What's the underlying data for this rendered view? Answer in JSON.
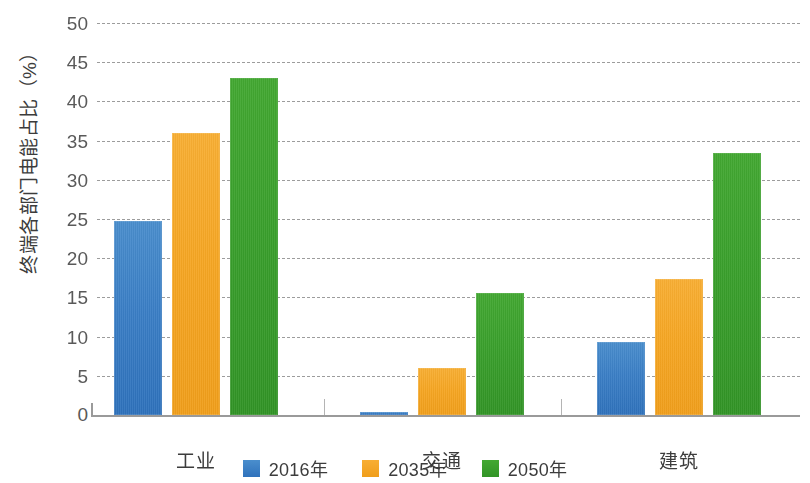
{
  "chart_data": {
    "type": "bar",
    "title": "",
    "subtitle": "",
    "xlabel": "",
    "ylabel": "终端各部门电能占比（%）",
    "ylim": [
      0,
      50
    ],
    "ytick_step": 5,
    "yticks": [
      "50",
      "45",
      "40",
      "35",
      "30",
      "25",
      "20",
      "15",
      "10",
      "5",
      "0"
    ],
    "ytick_values": [
      50,
      45,
      40,
      35,
      30,
      25,
      20,
      15,
      10,
      5,
      0
    ],
    "grid": true,
    "grid_style": "dashed",
    "legend_position": "bottom-center",
    "categories": [
      "工业",
      "交通",
      "建筑"
    ],
    "series": [
      {
        "name": "2016年",
        "color": "#3C7FC4",
        "values": [
          24.8,
          0.4,
          9.3
        ]
      },
      {
        "name": "2035年",
        "color": "#F5A623",
        "values": [
          36.0,
          6.0,
          17.3
        ]
      },
      {
        "name": "2050年",
        "color": "#3CA02C",
        "values": [
          43.0,
          15.5,
          33.4
        ]
      }
    ]
  },
  "axis": {
    "y_title": "终端各部门电能占比（%）"
  },
  "legend": {
    "items": [
      {
        "label": "2016年",
        "color": "#3C7FC4"
      },
      {
        "label": "2035年",
        "color": "#F5A623"
      },
      {
        "label": "2050年",
        "color": "#3CA02C"
      }
    ]
  }
}
